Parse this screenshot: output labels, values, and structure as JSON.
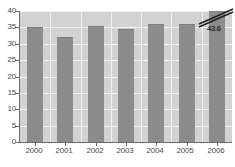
{
  "chart_data": {
    "type": "bar",
    "title": "",
    "subtitle": "",
    "xlabel": "",
    "ylabel": "",
    "categories": [
      "2000",
      "2001",
      "2002",
      "2003",
      "2004",
      "2005",
      "2006"
    ],
    "values": [
      35.0,
      32.0,
      35.5,
      34.5,
      36.0,
      36.0,
      43.6
    ],
    "series": [
      {
        "name": "",
        "values": [
          35.0,
          32.0,
          35.5,
          34.5,
          36.0,
          36.0,
          43.6
        ]
      }
    ],
    "ylim": [
      0,
      40
    ],
    "xlim_categories": 7,
    "yticks": [
      0,
      5,
      10,
      15,
      20,
      25,
      30,
      35,
      40
    ],
    "ytick_labels": [
      "0",
      "5",
      "10",
      "15",
      "20",
      "25",
      "30",
      "35",
      "40"
    ],
    "xtick_labels": [
      "2000",
      "2001",
      "2002",
      "2003",
      "2004",
      "2005",
      "2006"
    ],
    "grid": true,
    "grid_axis": "both",
    "legend": false,
    "legend_position": "none",
    "annotations": [
      {
        "name": "axis-break-label",
        "text": "43.6",
        "category": "2006",
        "note": "value exceeds axis maximum; bar is truncated with a double-slash axis break"
      }
    ],
    "colors": {
      "bar": "#8c8c8c",
      "bar_edge": "#7d7d7d",
      "plot_background": "#d2d2d2",
      "gridline": "#f2f2f2",
      "axis": "#6b6b6b",
      "tick_label": "#4a4a4a",
      "annotation_text": "#2b2b2b",
      "figure_background": "#ffffff"
    }
  }
}
